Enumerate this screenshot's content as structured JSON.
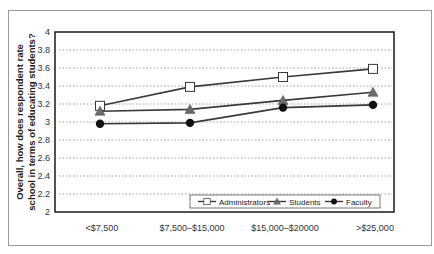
{
  "chart_data": {
    "type": "line",
    "title": "",
    "xlabel": "",
    "ylabel": "Overall, how does respondent rate school in terms of educating students?",
    "ylabel_lines": [
      "Overall, how does respondent rate",
      "school in terms of educating students?"
    ],
    "categories": [
      "<$7,500",
      "$7,500–$15,000",
      "$15,000–$20000",
      ">$25,000"
    ],
    "ylim": [
      2,
      4
    ],
    "yticks": [
      "2",
      "2.2",
      "2.4",
      "2.6",
      "2.8",
      "3",
      "3.2",
      "3.4",
      "3.6",
      "3.8",
      "4"
    ],
    "grid": "horizontal dotted",
    "legend_position": "bottom-right inside plot",
    "series": [
      {
        "name": "Administrators",
        "marker": "open-square",
        "values": [
          3.18,
          3.39,
          3.5,
          3.59
        ]
      },
      {
        "name": "Students",
        "marker": "filled-triangle",
        "values": [
          3.12,
          3.14,
          3.24,
          3.33
        ]
      },
      {
        "name": "Faculty",
        "marker": "filled-circle",
        "values": [
          2.98,
          2.99,
          3.16,
          3.19
        ]
      }
    ]
  },
  "colors": {
    "line": "#3a3a3a",
    "triangle_fill": "#6b6b6b",
    "circle_fill": "#111111",
    "grid": "#9a9a9a"
  }
}
